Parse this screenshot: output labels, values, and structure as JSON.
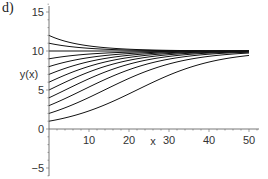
{
  "panel_label": "d)",
  "chart_data": {
    "type": "line",
    "title": "",
    "panel": "d)",
    "xlabel": "x",
    "ylabel": "y(x)",
    "xlim": [
      0,
      50
    ],
    "ylim": [
      -7,
      16
    ],
    "x_ticks": [
      10,
      20,
      30,
      40,
      50
    ],
    "y_ticks": [
      -5,
      0,
      5,
      10,
      15
    ],
    "grid": false,
    "legend": null,
    "model": {
      "K": 10,
      "r": 0.1
    },
    "series": [
      {
        "name": "y0=12",
        "y0": 12
      },
      {
        "name": "y0=11",
        "y0": 11
      },
      {
        "name": "y0=10",
        "y0": 10
      },
      {
        "name": "y0=9",
        "y0": 9
      },
      {
        "name": "y0=8",
        "y0": 8
      },
      {
        "name": "y0=7",
        "y0": 7
      },
      {
        "name": "y0=6",
        "y0": 6
      },
      {
        "name": "y0=5",
        "y0": 5
      },
      {
        "name": "y0=4",
        "y0": 4
      },
      {
        "name": "y0=3",
        "y0": 3
      },
      {
        "name": "y0=2",
        "y0": 2
      },
      {
        "name": "y0=1",
        "y0": 1
      }
    ],
    "sample_points": {
      "x": [
        0,
        10,
        20,
        30,
        40,
        50
      ],
      "y0=1": [
        1.0,
        2.32,
        4.51,
        6.91,
        8.58,
        9.43
      ],
      "y0=5": [
        5.0,
        7.31,
        8.81,
        9.53,
        9.82,
        9.93
      ],
      "y0=12": [
        12.0,
        10.82,
        10.28,
        10.1,
        10.04,
        10.01
      ]
    }
  }
}
